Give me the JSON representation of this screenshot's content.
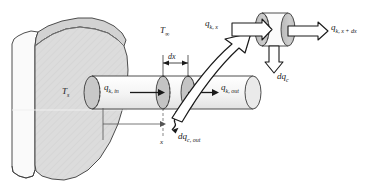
{
  "figure": {
    "type": "engineering-diagram",
    "background_color": "#ffffff"
  },
  "colors": {
    "wall_fill": "#dcdcdc",
    "wall_side_fill": "#fafafa",
    "wall_top_fill": "#d2d2d2",
    "fin_fill": "#f2f2f2",
    "fin_cap_fill": "#c8c8c8",
    "outline": "#3a3a3a",
    "text": "#1a1a1a",
    "arrow_fill": "#ffffff"
  },
  "labels": {
    "wall_temperature": {
      "symbol": "T",
      "subscript": "s"
    },
    "ambient_temperature": {
      "symbol": "T",
      "subscript": "∞"
    },
    "conduction_in": {
      "symbol": "q",
      "subscript": "k, in"
    },
    "conduction_out": {
      "symbol": "q",
      "subscript": "k, out"
    },
    "convection_out": {
      "symbol": "dq",
      "subscript": "c, out"
    },
    "element_length": {
      "symbol": "dx"
    },
    "axis": {
      "symbol": "x"
    },
    "detail_conduction_in": {
      "symbol": "q",
      "subscript": "k, x"
    },
    "detail_conduction_out": {
      "symbol": "q",
      "subscript": "k, x + dx"
    },
    "detail_convection": {
      "symbol": "dq",
      "subscript": "c"
    }
  },
  "elements": {
    "wall": "solid-wall-block",
    "fin": "cylindrical-fin",
    "element_slice": "differential-element-dx",
    "detail_view": "magnified-control-volume",
    "callout": "zoom-callout-arrow"
  }
}
